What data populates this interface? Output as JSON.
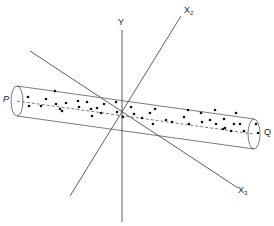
{
  "diagram": {
    "labels": {
      "y_axis": "Y",
      "x2_axis_main": "X",
      "x2_axis_sub": "2",
      "x3_axis_main": "X",
      "x3_axis_sub": "3",
      "end_p": "P",
      "end_q": "Q"
    },
    "colors": {
      "line": "#333333",
      "dot": "#111111",
      "background": "#ffffff"
    },
    "axes": [
      {
        "name": "Y",
        "x1": 122,
        "y1": 30,
        "x2": 122,
        "y2": 222
      },
      {
        "name": "X2",
        "x1": 181,
        "y1": 16,
        "x2": 70,
        "y2": 196
      },
      {
        "name": "X3",
        "x1": 30,
        "y1": 51,
        "x2": 238,
        "y2": 188
      }
    ],
    "cylinder": {
      "left_center": [
        17,
        101
      ],
      "right_center": [
        254,
        134
      ],
      "radius_y": 15,
      "radius_x": 6
    },
    "points": [
      [
        28,
        97
      ],
      [
        29,
        106
      ],
      [
        46,
        99
      ],
      [
        41,
        106
      ],
      [
        55,
        91
      ],
      [
        56,
        104
      ],
      [
        60,
        109
      ],
      [
        66,
        103
      ],
      [
        62,
        111
      ],
      [
        79,
        107
      ],
      [
        78,
        101
      ],
      [
        87,
        102
      ],
      [
        91,
        109
      ],
      [
        97,
        108
      ],
      [
        104,
        104
      ],
      [
        92,
        116
      ],
      [
        101,
        113
      ],
      [
        116,
        102
      ],
      [
        117,
        112
      ],
      [
        131,
        107
      ],
      [
        123,
        117
      ],
      [
        134,
        114
      ],
      [
        142,
        118
      ],
      [
        150,
        113
      ],
      [
        155,
        109
      ],
      [
        153,
        124
      ],
      [
        166,
        120
      ],
      [
        172,
        122
      ],
      [
        184,
        117
      ],
      [
        188,
        110
      ],
      [
        189,
        124
      ],
      [
        201,
        113
      ],
      [
        202,
        122
      ],
      [
        210,
        120
      ],
      [
        215,
        110
      ],
      [
        216,
        124
      ],
      [
        224,
        119
      ],
      [
        225,
        128
      ],
      [
        234,
        124
      ],
      [
        236,
        113
      ],
      [
        240,
        124
      ],
      [
        256,
        124
      ],
      [
        258,
        133
      ],
      [
        244,
        131
      ],
      [
        231,
        131
      ],
      [
        223,
        129
      ]
    ]
  }
}
